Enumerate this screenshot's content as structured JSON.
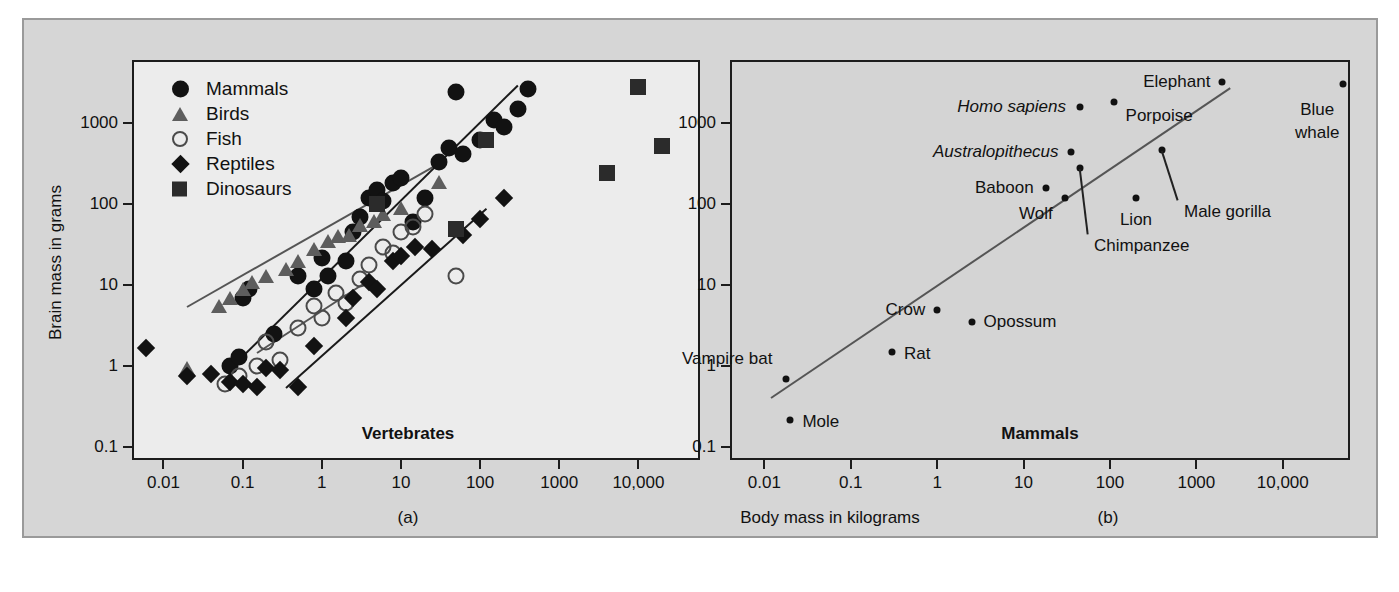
{
  "figure": {
    "x_axis_title": "Body mass in kilograms",
    "y_axis_title": "Brain mass in grams",
    "panel_a_letter": "(a)",
    "panel_b_letter": "(b)"
  },
  "panel_a": {
    "title": "Vertebrates",
    "legend": [
      {
        "label": "Mammals",
        "marker": "circle",
        "color": "#121212"
      },
      {
        "label": "Birds",
        "marker": "triangle",
        "color": "#5d5d5d"
      },
      {
        "label": "Fish",
        "marker": "open-circle",
        "color": "#4a4a4a"
      },
      {
        "label": "Reptiles",
        "marker": "diamond",
        "color": "#121212"
      },
      {
        "label": "Dinosaurs",
        "marker": "square",
        "color": "#2b2b2b"
      }
    ],
    "x_ticks": [
      "0.01",
      "0.1",
      "1",
      "10",
      "100",
      "1000",
      "10,000"
    ],
    "y_ticks": [
      "0.1",
      "1",
      "10",
      "100",
      "1000"
    ]
  },
  "panel_b": {
    "title": "Mammals",
    "x_ticks": [
      "0.01",
      "0.1",
      "1",
      "10",
      "100",
      "1000",
      "10,000"
    ],
    "y_ticks": [
      "0.1",
      "1",
      "10",
      "100",
      "1000"
    ],
    "labels": [
      {
        "text": "Homo sapiens",
        "italic": true
      },
      {
        "text": "Australopithecus",
        "italic": true
      },
      {
        "text": "Baboon",
        "italic": false
      },
      {
        "text": "Wolf",
        "italic": false
      },
      {
        "text": "Chimpanzee",
        "italic": false
      },
      {
        "text": "Lion",
        "italic": false
      },
      {
        "text": "Male gorilla",
        "italic": false
      },
      {
        "text": "Elephant",
        "italic": false
      },
      {
        "text": "Porpoise",
        "italic": false
      },
      {
        "text": "Blue",
        "italic": false
      },
      {
        "text": "whale",
        "italic": false
      },
      {
        "text": "Crow",
        "italic": false
      },
      {
        "text": "Opossum",
        "italic": false
      },
      {
        "text": "Vampire bat",
        "italic": false
      },
      {
        "text": "Rat",
        "italic": false
      },
      {
        "text": "Mole",
        "italic": false
      }
    ]
  },
  "chart_data": [
    {
      "type": "scatter",
      "panel": "a",
      "title": "Vertebrates",
      "xlabel": "Body mass in kilograms",
      "ylabel": "Brain mass in grams",
      "xscale": "log",
      "yscale": "log",
      "xlim": [
        0.004,
        60000
      ],
      "ylim": [
        0.07,
        6000
      ],
      "xticks": [
        0.01,
        0.1,
        1,
        10,
        100,
        1000,
        10000
      ],
      "yticks": [
        0.1,
        1,
        10,
        100,
        1000
      ],
      "grid": false,
      "legend_position": "top-left",
      "series": [
        {
          "name": "Mammals",
          "marker": "filled-circle",
          "color": "#121212",
          "points": [
            [
              0.07,
              1.0
            ],
            [
              0.09,
              1.3
            ],
            [
              0.1,
              7.0
            ],
            [
              0.12,
              9.0
            ],
            [
              0.25,
              2.5
            ],
            [
              0.5,
              13.0
            ],
            [
              0.8,
              9.0
            ],
            [
              1.0,
              22.0
            ],
            [
              1.2,
              13.0
            ],
            [
              2.0,
              20.0
            ],
            [
              2.5,
              45.0
            ],
            [
              3.0,
              70.0
            ],
            [
              4.0,
              120.0
            ],
            [
              5.0,
              150.0
            ],
            [
              6.0,
              110.0
            ],
            [
              8.0,
              180.0
            ],
            [
              10.0,
              210.0
            ],
            [
              14.0,
              60.0
            ],
            [
              20.0,
              120.0
            ],
            [
              30.0,
              330.0
            ],
            [
              40.0,
              500.0
            ],
            [
              50.0,
              2400.0
            ],
            [
              60.0,
              420.0
            ],
            [
              100.0,
              620.0
            ],
            [
              150.0,
              1100.0
            ],
            [
              200.0,
              900.0
            ],
            [
              300.0,
              1500.0
            ],
            [
              400.0,
              2600.0
            ]
          ]
        },
        {
          "name": "Birds",
          "marker": "filled-triangle",
          "color": "#5d5d5d",
          "points": [
            [
              0.02,
              0.95
            ],
            [
              0.05,
              5.5
            ],
            [
              0.07,
              7.0
            ],
            [
              0.1,
              9.0
            ],
            [
              0.13,
              11.0
            ],
            [
              0.2,
              13.0
            ],
            [
              0.35,
              16.0
            ],
            [
              0.5,
              20.0
            ],
            [
              0.8,
              28.0
            ],
            [
              1.2,
              35.0
            ],
            [
              1.6,
              40.0
            ],
            [
              2.2,
              42.0
            ],
            [
              3.0,
              55.0
            ],
            [
              4.5,
              62.0
            ],
            [
              6.0,
              75.0
            ],
            [
              10.0,
              90.0
            ],
            [
              30.0,
              190.0
            ]
          ]
        },
        {
          "name": "Fish",
          "marker": "open-circle",
          "color": "#4a4a4a",
          "points": [
            [
              0.06,
              0.6
            ],
            [
              0.09,
              0.75
            ],
            [
              0.15,
              1.0
            ],
            [
              0.2,
              2.0
            ],
            [
              0.3,
              1.2
            ],
            [
              0.5,
              3.0
            ],
            [
              0.8,
              5.5
            ],
            [
              1.0,
              4.0
            ],
            [
              1.5,
              8.0
            ],
            [
              2.0,
              6.0
            ],
            [
              3.0,
              12.0
            ],
            [
              4.0,
              18.0
            ],
            [
              6.0,
              30.0
            ],
            [
              8.0,
              25.0
            ],
            [
              10.0,
              45.0
            ],
            [
              14.0,
              52.0
            ],
            [
              20.0,
              75.0
            ],
            [
              50.0,
              13.0
            ]
          ]
        },
        {
          "name": "Reptiles",
          "marker": "filled-diamond",
          "color": "#121212",
          "points": [
            [
              0.006,
              1.7
            ],
            [
              0.02,
              0.75
            ],
            [
              0.04,
              0.8
            ],
            [
              0.07,
              0.65
            ],
            [
              0.1,
              0.6
            ],
            [
              0.15,
              0.55
            ],
            [
              0.2,
              0.95
            ],
            [
              0.3,
              0.9
            ],
            [
              0.5,
              0.55
            ],
            [
              0.8,
              1.8
            ],
            [
              2.0,
              4.0
            ],
            [
              2.5,
              7.0
            ],
            [
              4.0,
              11.0
            ],
            [
              5.0,
              9.0
            ],
            [
              8.0,
              20.0
            ],
            [
              10.0,
              23.0
            ],
            [
              15.0,
              30.0
            ],
            [
              25.0,
              28.0
            ],
            [
              60.0,
              42.0
            ],
            [
              100.0,
              65.0
            ],
            [
              200.0,
              120.0
            ]
          ]
        },
        {
          "name": "Dinosaurs",
          "marker": "filled-square",
          "color": "#2b2b2b",
          "points": [
            [
              5.0,
              100.0
            ],
            [
              50.0,
              50.0
            ],
            [
              120.0,
              620.0
            ],
            [
              4000.0,
              240.0
            ],
            [
              10000.0,
              2800.0
            ],
            [
              20000.0,
              520.0
            ]
          ]
        }
      ],
      "fit_lines": [
        {
          "name": "mammals-fit",
          "color": "#1a1a1a",
          "x": [
            0.08,
            300
          ],
          "y": [
            1.1,
            3000
          ]
        },
        {
          "name": "birds-fish-fit",
          "color": "#555555",
          "x": [
            0.02,
            30
          ],
          "y": [
            5.5,
            320
          ]
        },
        {
          "name": "fish-fit",
          "color": "#555555",
          "x": [
            0.15,
            4.0
          ],
          "y": [
            1.5,
            12.0
          ]
        },
        {
          "name": "reptiles-fit",
          "color": "#1a1a1a",
          "x": [
            0.35,
            120
          ],
          "y": [
            0.55,
            90
          ]
        }
      ]
    },
    {
      "type": "scatter",
      "panel": "b",
      "title": "Mammals",
      "xlabel": "Body mass in kilograms",
      "ylabel": "Brain mass in grams",
      "xscale": "log",
      "yscale": "log",
      "xlim": [
        0.004,
        60000
      ],
      "ylim": [
        0.07,
        6000
      ],
      "xticks": [
        0.01,
        0.1,
        1,
        10,
        100,
        1000,
        10000
      ],
      "yticks": [
        0.1,
        1,
        10,
        100,
        1000
      ],
      "grid": false,
      "points": [
        {
          "label": "Mole",
          "x": 0.02,
          "y": 0.22,
          "label_side": "right"
        },
        {
          "label": "Vampire bat",
          "x": 0.018,
          "y": 0.7,
          "label_side": "left"
        },
        {
          "label": "Rat",
          "x": 0.3,
          "y": 1.5,
          "label_side": "right"
        },
        {
          "label": "Crow",
          "x": 1.0,
          "y": 5.0,
          "label_side": "left"
        },
        {
          "label": "Opossum",
          "x": 2.5,
          "y": 3.5,
          "label_side": "right"
        },
        {
          "label": "Wolf",
          "x": 30.0,
          "y": 120.0,
          "label_side": "left"
        },
        {
          "label": "Baboon",
          "x": 18.0,
          "y": 160.0,
          "label_side": "left"
        },
        {
          "label": "Lion",
          "x": 200.0,
          "y": 120.0,
          "label_side": "below"
        },
        {
          "label": "Chimpanzee",
          "x": 45.0,
          "y": 280.0,
          "label_side": "leader-down"
        },
        {
          "label": "Australopithecus",
          "x": 35.0,
          "y": 440.0,
          "label_side": "left"
        },
        {
          "label": "Male gorilla",
          "x": 400.0,
          "y": 470.0,
          "label_side": "leader-down"
        },
        {
          "label": "Homo sapiens",
          "x": 45.0,
          "y": 1600.0,
          "label_side": "left"
        },
        {
          "label": "Porpoise",
          "x": 110.0,
          "y": 1800.0,
          "label_side": "right"
        },
        {
          "label": "Elephant",
          "x": 2000.0,
          "y": 3200.0,
          "label_side": "left"
        },
        {
          "label": "Blue whale",
          "x": 50000.0,
          "y": 3000.0,
          "label_side": "below-left"
        }
      ],
      "fit_line": {
        "color": "#555555",
        "x": [
          0.012,
          2500
        ],
        "y": [
          0.42,
          2800
        ]
      }
    }
  ]
}
